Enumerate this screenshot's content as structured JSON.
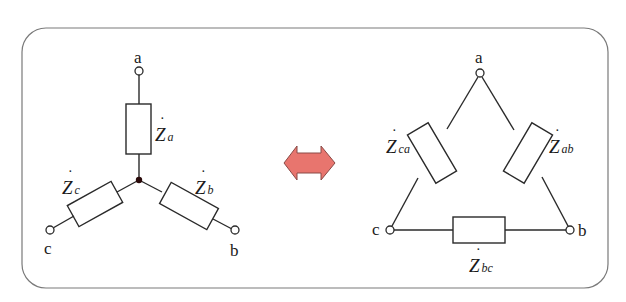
{
  "figure": {
    "colors": {
      "frame": "#7a7a7a",
      "wire": "#2a2a2a",
      "arrow_fill": "#e8756e",
      "arrow_stroke": "#8a4a46",
      "center_node": "#2a0a0a"
    }
  },
  "star": {
    "terminals": {
      "a": "a",
      "b": "b",
      "c": "c"
    },
    "impedances": {
      "a": {
        "symbol": "Z",
        "sub": "a"
      },
      "b": {
        "symbol": "Z",
        "sub": "b"
      },
      "c": {
        "symbol": "Z",
        "sub": "c"
      }
    }
  },
  "equivalence_arrow": {
    "icon": "double-arrow-icon"
  },
  "delta": {
    "terminals": {
      "a": "a",
      "b": "b",
      "c": "c"
    },
    "impedances": {
      "ab": {
        "symbol": "Z",
        "sub": "ab"
      },
      "bc": {
        "symbol": "Z",
        "sub": "bc"
      },
      "ca": {
        "symbol": "Z",
        "sub": "ca"
      }
    }
  },
  "dot_accent": "·"
}
